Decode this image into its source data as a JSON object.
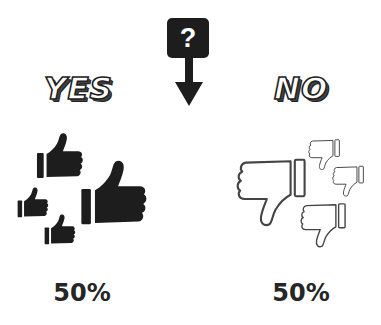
{
  "question": {
    "symbol": "?",
    "icon": "question-box-arrow-down-icon",
    "color": "#1d1d1d"
  },
  "options": [
    {
      "label": "YES",
      "icon": "thumbs-up-icon",
      "icon_style": "filled",
      "icon_count": 4,
      "percentage": "50%"
    },
    {
      "label": "NO",
      "icon": "thumbs-down-icon",
      "icon_style": "outline",
      "icon_count": 4,
      "percentage": "50%"
    }
  ],
  "colors": {
    "ink": "#1d1d1d",
    "background": "#ffffff",
    "text": "#262626"
  }
}
